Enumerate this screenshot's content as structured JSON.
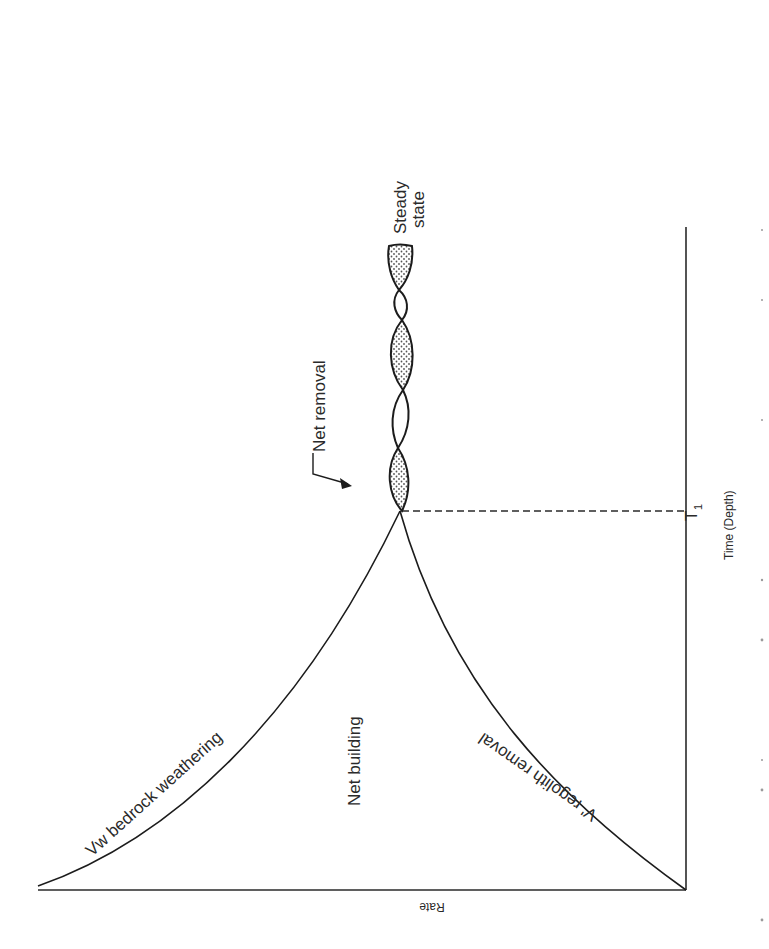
{
  "figure": {
    "orientation": "rotated 90 degrees clockwise",
    "axes": {
      "y_label": "Rate",
      "x_label": "Time (Depth)",
      "x_marker": "T",
      "x_marker_subscript": "1"
    },
    "curves": [
      {
        "label": "Vw  bedrock weathering",
        "shape": "decreasing from high rate to meeting point at T1"
      },
      {
        "label": "V'  regolith removal",
        "shape": "increasing from zero to meeting point at T1"
      }
    ],
    "regions": {
      "before_t1": "Net building",
      "after_t1_annotation": "Net removal",
      "end_state_line1": "Steady",
      "end_state_line2": "state"
    },
    "oscillation": {
      "description": "Curves intertwine after T1; stippled lobes mark net removal",
      "lobes": [
        "stippled",
        "open",
        "stippled",
        "open",
        "stippled (partial)"
      ]
    },
    "colors": {
      "ink": "#1c1c1c",
      "paper": "#ffffff",
      "stipple": "#555555"
    }
  }
}
